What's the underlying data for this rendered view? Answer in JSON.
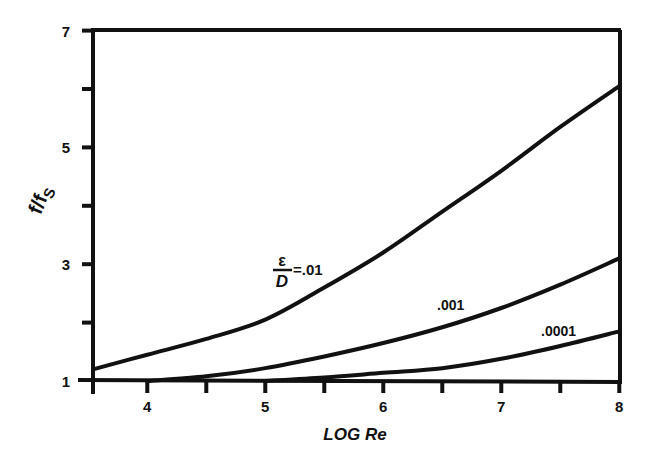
{
  "chart_data": {
    "type": "line",
    "title": "",
    "xlabel": "LOG Re",
    "ylabel": "f/fs",
    "xlim": [
      3.54,
      8
    ],
    "ylim": [
      1,
      7
    ],
    "x_ticks": [
      4,
      5,
      6,
      7,
      8
    ],
    "x_tick_labels": [
      "4",
      "5",
      "6",
      "7",
      "8"
    ],
    "x_minor_ticks": [
      3.54,
      4.5,
      5.5,
      6.5,
      7.5
    ],
    "y_ticks": [
      1,
      3,
      5,
      7
    ],
    "y_tick_labels": [
      "1",
      "3",
      "5",
      "7"
    ],
    "y_minor_ticks": [
      2,
      4,
      6
    ],
    "grid": false,
    "legend": "inline labels on curves",
    "series": [
      {
        "name": "ε/D = .01",
        "label_text": "=.01",
        "x": [
          3.54,
          4,
          4.5,
          5,
          5.5,
          6,
          6.5,
          7,
          7.5,
          8
        ],
        "y": [
          1.2,
          1.45,
          1.72,
          2.05,
          2.6,
          3.2,
          3.9,
          4.6,
          5.35,
          6.05
        ]
      },
      {
        "name": ".001",
        "label_text": ".001",
        "x": [
          4,
          4.5,
          5,
          5.5,
          6,
          6.5,
          7,
          7.5,
          8
        ],
        "y": [
          1.0,
          1.08,
          1.22,
          1.42,
          1.65,
          1.92,
          2.25,
          2.65,
          3.1
        ]
      },
      {
        "name": ".0001",
        "label_text": ".0001",
        "x": [
          5,
          5.5,
          6,
          6.5,
          7,
          7.5,
          8
        ],
        "y": [
          1.0,
          1.06,
          1.14,
          1.22,
          1.38,
          1.6,
          1.85
        ]
      }
    ],
    "annotations": [
      {
        "text": "ε/D=.01",
        "x": 4.9,
        "y": 3.0
      },
      {
        "text": ".001",
        "x": 6.25,
        "y": 2.2
      },
      {
        "text": ".0001",
        "x": 7.3,
        "y": 1.75
      }
    ]
  },
  "labels": {
    "x_axis_title": "LOG Re",
    "y_axis_title_main": "f/f",
    "y_axis_title_sub": "S",
    "eps_numerator": "ε",
    "eps_denominator": "D",
    "eps_value": "=.01",
    "curve2": ".001",
    "curve3": ".0001",
    "x_ticks": [
      "4",
      "5",
      "6",
      "7",
      "8"
    ],
    "y_ticks": [
      "1",
      "3",
      "5",
      "7"
    ]
  }
}
